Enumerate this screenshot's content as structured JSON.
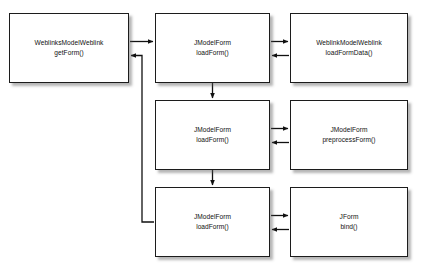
{
  "diagram": {
    "type": "call-flow-diagram",
    "background_color": "#ffffff",
    "node_fill_color": "#ffffff",
    "node_border_color": "#1c1c1c",
    "edge_color": "#111111",
    "nodes": [
      {
        "id": "weblinks-model-getform",
        "class_name": "WeblinksModelWeblink",
        "method_name": "getForm()",
        "column": "left",
        "row": "top"
      },
      {
        "id": "jmodelform-loadform-1",
        "class_name": "JModelForm",
        "method_name": "loadForm()",
        "column": "middle",
        "row": "top"
      },
      {
        "id": "weblink-model-loadformdata",
        "class_name": "WeblinkModelWeblink",
        "method_name": "loadFormData()",
        "column": "right",
        "row": "top"
      },
      {
        "id": "jmodelform-loadform-2",
        "class_name": "JModelForm",
        "method_name": "loadForm()",
        "column": "middle",
        "row": "middle"
      },
      {
        "id": "jmodelform-preprocessform",
        "class_name": "JModelForm",
        "method_name": "preprocessForm()",
        "column": "right",
        "row": "middle"
      },
      {
        "id": "jmodelform-loadform-3",
        "class_name": "JModelForm",
        "method_name": "loadForm()",
        "column": "middle",
        "row": "bottom"
      },
      {
        "id": "jform-bind",
        "class_name": "JForm",
        "method_name": "bind()",
        "column": "right",
        "row": "bottom"
      }
    ],
    "edges": [
      {
        "id": "call-getform-to-loadform1",
        "from": "weblinks-model-getform",
        "to": "jmodelform-loadform-1",
        "kind": "call",
        "direction": "right"
      },
      {
        "id": "return-loadform3-to-getform",
        "from": "jmodelform-loadform-3",
        "to": "weblinks-model-getform",
        "kind": "return",
        "direction": "left"
      },
      {
        "id": "call-loadform1-to-loadformdata",
        "from": "jmodelform-loadform-1",
        "to": "weblink-model-loadformdata",
        "kind": "call",
        "direction": "right"
      },
      {
        "id": "return-loadformdata-to-loadform1",
        "from": "weblink-model-loadformdata",
        "to": "jmodelform-loadform-1",
        "kind": "return",
        "direction": "left"
      },
      {
        "id": "flow-loadform1-to-loadform2",
        "from": "jmodelform-loadform-1",
        "to": "jmodelform-loadform-2",
        "kind": "flow",
        "direction": "down"
      },
      {
        "id": "call-loadform2-to-preprocessform",
        "from": "jmodelform-loadform-2",
        "to": "jmodelform-preprocessform",
        "kind": "call",
        "direction": "right"
      },
      {
        "id": "return-preprocessform-to-loadform2",
        "from": "jmodelform-preprocessform",
        "to": "jmodelform-loadform-2",
        "kind": "return",
        "direction": "left"
      },
      {
        "id": "flow-loadform2-to-loadform3",
        "from": "jmodelform-loadform-2",
        "to": "jmodelform-loadform-3",
        "kind": "flow",
        "direction": "down"
      },
      {
        "id": "call-loadform3-to-bind",
        "from": "jmodelform-loadform-3",
        "to": "jform-bind",
        "kind": "call",
        "direction": "right"
      },
      {
        "id": "return-bind-to-loadform3",
        "from": "jform-bind",
        "to": "jmodelform-loadform-3",
        "kind": "return",
        "direction": "left"
      }
    ]
  }
}
